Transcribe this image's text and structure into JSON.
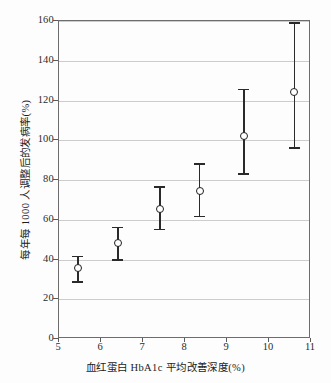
{
  "chart_data": {
    "type": "scatter",
    "title": "",
    "xlabel": "血红蛋白 HbA1c 平均改善深度(%)",
    "ylabel": "每年每 1000 人调整后的发病率(%)",
    "xlim": [
      5,
      11
    ],
    "ylim": [
      0,
      160
    ],
    "xticks": [
      "5",
      "6",
      "7",
      "8",
      "9",
      "10",
      "11"
    ],
    "yticks": [
      "0",
      "20",
      "40",
      "60",
      "80",
      "100",
      "120",
      "140",
      "160"
    ],
    "grid": "horizontal",
    "legend": "none",
    "marker": "open-circle",
    "errorbars": "vertical-with-caps",
    "x": [
      5.45,
      6.4,
      7.4,
      8.35,
      9.4,
      10.6
    ],
    "y": [
      35.5,
      48.5,
      65.5,
      74.5,
      102.0,
      124.5
    ],
    "y_lower": [
      29.0,
      40.0,
      55.5,
      62.0,
      83.5,
      96.5
    ],
    "y_upper": [
      42.0,
      56.5,
      77.0,
      88.5,
      126.0,
      159.5
    ],
    "points": [
      {
        "x": 5.45,
        "y": 35.5,
        "lo": 29.0,
        "hi": 42.0
      },
      {
        "x": 6.4,
        "y": 48.5,
        "lo": 40.0,
        "hi": 56.5
      },
      {
        "x": 7.4,
        "y": 65.5,
        "lo": 55.5,
        "hi": 77.0
      },
      {
        "x": 8.35,
        "y": 74.5,
        "lo": 62.0,
        "hi": 88.5
      },
      {
        "x": 9.4,
        "y": 102.0,
        "lo": 83.5,
        "hi": 126.0
      },
      {
        "x": 10.6,
        "y": 124.5,
        "lo": 96.5,
        "hi": 159.5
      }
    ],
    "colors": {
      "marker_edge": "#1f1f1f",
      "marker_face": "#ffffff",
      "errorbar": "#2a2a2a",
      "gridline": "#cccccc",
      "axis": "#6d6d6d",
      "text": "#1c1c1c",
      "background": "#fdfdfd"
    }
  }
}
